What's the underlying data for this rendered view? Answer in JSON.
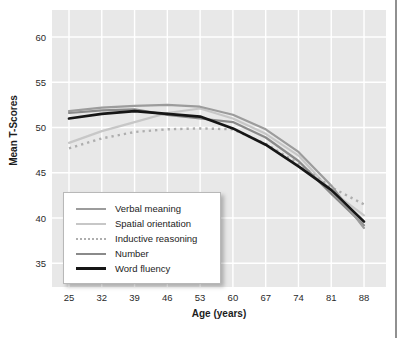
{
  "page": {
    "background": "#ffffff"
  },
  "colors": {
    "plot_background": "#e8e8e8",
    "gridline": "#ffffff",
    "tick_text": "#2a2a2a",
    "page_edge_rule": "#909090"
  },
  "chart_data": {
    "type": "line",
    "title": "",
    "xlabel": "Age (years)",
    "ylabel": "Mean T-Scores",
    "x": [
      25,
      32,
      39,
      46,
      53,
      60,
      67,
      74,
      81,
      88
    ],
    "x_tick_labels": [
      "25",
      "32",
      "39",
      "46",
      "53",
      "60",
      "67",
      "74",
      "81",
      "88"
    ],
    "y_ticks": [
      35,
      40,
      45,
      50,
      55,
      60
    ],
    "y_tick_labels": [
      "35",
      "40",
      "45",
      "50",
      "55",
      "60"
    ],
    "ylim": [
      32,
      63
    ],
    "grid": true,
    "legend_position": "bottom-left-inside",
    "series": [
      {
        "name": "Spatial orientation",
        "color": "#c7c7c7",
        "style": "solid",
        "width": 2.2,
        "values": [
          48.3,
          49.6,
          50.6,
          51.6,
          52.1,
          51.0,
          49.3,
          46.9,
          43.0,
          40.3
        ]
      },
      {
        "name": "Inductive reasoning",
        "color": "#aeaeae",
        "style": "dotted",
        "width": 2.4,
        "values": [
          47.7,
          48.8,
          49.5,
          49.8,
          49.9,
          49.8,
          48.2,
          46.0,
          43.4,
          41.5
        ]
      },
      {
        "name": "Number",
        "color": "#8a8a8a",
        "style": "solid",
        "width": 2.2,
        "values": [
          51.6,
          51.9,
          52.0,
          51.4,
          51.0,
          50.6,
          48.9,
          46.3,
          42.7,
          39.2
        ]
      },
      {
        "name": "Verbal meaning",
        "color": "#9c9c9c",
        "style": "solid",
        "width": 2.2,
        "values": [
          51.8,
          52.2,
          52.4,
          52.5,
          52.3,
          51.4,
          49.8,
          47.3,
          43.6,
          38.9
        ]
      },
      {
        "name": "Word fluency",
        "color": "#161616",
        "style": "solid",
        "width": 2.7,
        "values": [
          51.0,
          51.5,
          51.8,
          51.5,
          51.2,
          49.9,
          48.1,
          45.7,
          43.1,
          39.6
        ]
      }
    ],
    "legend_order": [
      "Verbal meaning",
      "Spatial orientation",
      "Inductive reasoning",
      "Number",
      "Word fluency"
    ]
  }
}
